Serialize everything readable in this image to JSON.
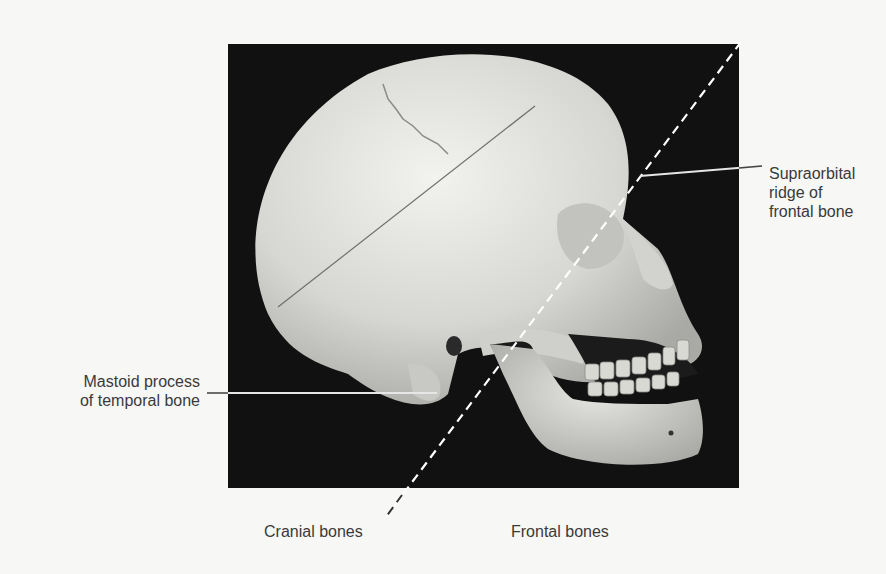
{
  "figure": {
    "background_color": "#f7f7f5",
    "photo_background": "#111111"
  },
  "labels": {
    "supraorbital": {
      "line1": "Supraorbital",
      "line2": "ridge of",
      "line3": "frontal bone"
    },
    "mastoid": {
      "line1": "Mastoid process",
      "line2": "of temporal bone"
    },
    "cranial": "Cranial bones",
    "frontal": "Frontal bones"
  },
  "annotations": {
    "dividing_line_style": "dashed",
    "dividing_line_color": "#ffffff",
    "leader_line_color": "#e8e8e8"
  }
}
